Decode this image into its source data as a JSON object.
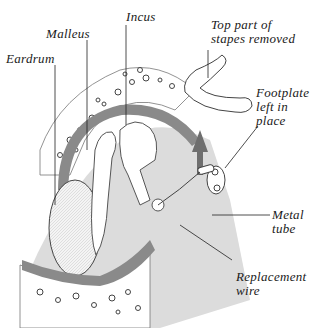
{
  "diagram": {
    "labels": {
      "eardrum": "Eardrum",
      "malleus": "Malleus",
      "incus": "Incus",
      "stapes_removed": "Top part of\nstapes removed",
      "footplate": "Footplate\nleft in\nplace",
      "metal_tube": "Metal\ntube",
      "replacement_wire": "Replacement\nwire"
    },
    "colors": {
      "bone_fill": "#ffffff",
      "tissue_gray": "#9a9a9a",
      "shade_gray": "#c8c8c8",
      "ink": "#1a1a1a",
      "arrow": "#6e6e6e"
    }
  }
}
